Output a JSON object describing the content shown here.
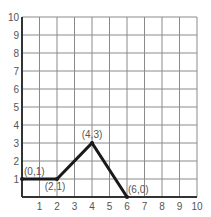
{
  "chart_data": {
    "type": "line",
    "title": "",
    "xlabel": "",
    "ylabel": "",
    "xlim": [
      0,
      10
    ],
    "ylim": [
      0,
      10
    ],
    "grid": true,
    "x_ticks": [
      "1",
      "2",
      "3",
      "4",
      "5",
      "6",
      "7",
      "8",
      "9",
      "10"
    ],
    "y_ticks": [
      "1",
      "2",
      "3",
      "4",
      "5",
      "6",
      "7",
      "8",
      "9",
      "10"
    ],
    "series": [
      {
        "name": "path",
        "points": [
          [
            0,
            1
          ],
          [
            2,
            1
          ],
          [
            4,
            3
          ],
          [
            6,
            0
          ]
        ],
        "color": "#1a1a1a"
      }
    ],
    "annotations": [
      {
        "text": "(0,1)",
        "x": 0,
        "y": 1
      },
      {
        "text": "(2,1)",
        "x": 2,
        "y": 1
      },
      {
        "text": "(4,3)",
        "x": 4,
        "y": 3
      },
      {
        "text": "(6,0)",
        "x": 6,
        "y": 0
      }
    ],
    "legend": null
  }
}
